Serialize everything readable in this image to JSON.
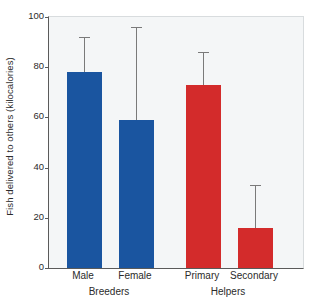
{
  "chart_data": {
    "type": "bar",
    "title": "",
    "xlabel": "",
    "ylabel": "Fish delivered to others (kilocalories)",
    "ylim": [
      0,
      100
    ],
    "yticks": [
      0,
      20,
      40,
      60,
      80,
      100
    ],
    "ytick_labels": [
      "0",
      "20",
      "40",
      "60",
      "80",
      "100"
    ],
    "grid": false,
    "legend": "none",
    "categories": [
      "Male",
      "Female",
      "Primary",
      "Secondary"
    ],
    "values": [
      78,
      59,
      73,
      16
    ],
    "error_high": [
      92,
      96,
      86,
      33
    ],
    "colors": [
      "#1a55a0",
      "#1a55a0",
      "#d32b2b",
      "#d32b2b"
    ],
    "groups": [
      {
        "label": "Breeders",
        "categories": [
          "Male",
          "Female"
        ],
        "color": "#1a55a0"
      },
      {
        "label": "Helpers",
        "categories": [
          "Primary",
          "Secondary"
        ],
        "color": "#d32b2b"
      }
    ],
    "bars": [
      {
        "category": "Male",
        "value": 78,
        "error_top": 92,
        "color": "#1a55a0",
        "group": "Breeders"
      },
      {
        "category": "Female",
        "value": 59,
        "error_top": 96,
        "color": "#1a55a0",
        "group": "Breeders"
      },
      {
        "category": "Primary",
        "value": 73,
        "error_top": 86,
        "color": "#d32b2b",
        "group": "Helpers"
      },
      {
        "category": "Secondary",
        "value": 16,
        "error_top": 33,
        "color": "#d32b2b",
        "group": "Helpers"
      }
    ]
  },
  "axis": {
    "y_title": "Fish delivered to others (kilocalories)"
  }
}
